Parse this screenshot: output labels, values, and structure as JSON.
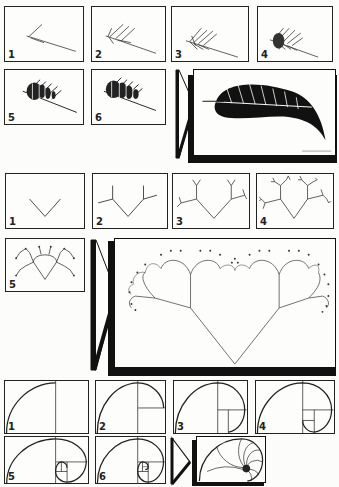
{
  "figure": {
    "rows": [
      {
        "name": "fern",
        "steps": [
          {
            "label": "1"
          },
          {
            "label": "2"
          },
          {
            "label": "3"
          },
          {
            "label": "4"
          },
          {
            "label": "5"
          },
          {
            "label": "6"
          }
        ],
        "result_caption": "fern result"
      },
      {
        "name": "tree",
        "steps": [
          {
            "label": "1"
          },
          {
            "label": "2"
          },
          {
            "label": "3"
          },
          {
            "label": "4"
          },
          {
            "label": "5"
          }
        ],
        "result_caption": "tree result"
      },
      {
        "name": "spiral",
        "steps": [
          {
            "label": "1"
          },
          {
            "label": "2"
          },
          {
            "label": "3"
          },
          {
            "label": "4"
          },
          {
            "label": "5"
          },
          {
            "label": "6"
          }
        ],
        "result_caption": "spiral result"
      }
    ]
  },
  "colors": {
    "ink": "#111111",
    "paper": "#fdfdfb"
  }
}
